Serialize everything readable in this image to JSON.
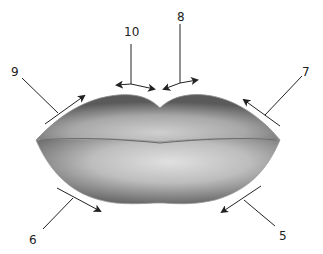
{
  "diagram": {
    "labels": [
      {
        "id": "5",
        "text": "5",
        "x": 279,
        "y": 230
      },
      {
        "id": "6",
        "text": "6",
        "x": 29,
        "y": 234
      },
      {
        "id": "7",
        "text": "7",
        "x": 302,
        "y": 66
      },
      {
        "id": "8",
        "text": "8",
        "x": 177,
        "y": 11
      },
      {
        "id": "9",
        "text": "9",
        "x": 11,
        "y": 66
      },
      {
        "id": "10",
        "text": "10",
        "x": 124,
        "y": 26
      }
    ],
    "colors": {
      "background": "#ffffff",
      "shade_dark": "#555555",
      "shade_mid": "#9a9a9a",
      "shade_light": "#d8d8d8",
      "line": "#222222"
    }
  }
}
